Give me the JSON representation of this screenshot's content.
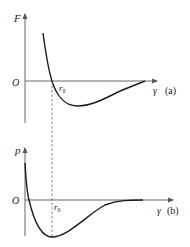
{
  "panels": [
    {
      "id": "a",
      "y_label": "F",
      "origin_label": "O",
      "x_label": "γ",
      "tag": "(a)",
      "marker_label": "r",
      "marker_sub": "0"
    },
    {
      "id": "b",
      "y_label": "p",
      "origin_label": "O",
      "x_label": "γ",
      "tag": "(b)",
      "marker_label": "r",
      "marker_sub": "0"
    }
  ],
  "colors": {
    "axis": "#555555",
    "curve": "#1a1a1a",
    "dashed": "#555555",
    "text": "#222222"
  }
}
